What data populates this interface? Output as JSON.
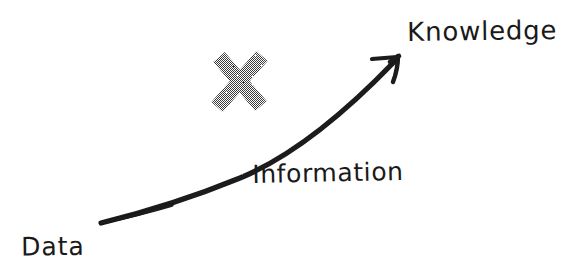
{
  "diagram": {
    "type": "hand-drawn-arrow-progression",
    "background_color": "#ffffff",
    "ink_color": "#1a1a1a",
    "mark_color": "#808080",
    "labels": {
      "start": "Data",
      "middle": "Information",
      "end": "Knowledge"
    },
    "marks": {
      "cross": "x-mark"
    },
    "icons": {
      "arrow": "curved-up-arrow-icon",
      "cross": "x-cross-icon"
    }
  }
}
